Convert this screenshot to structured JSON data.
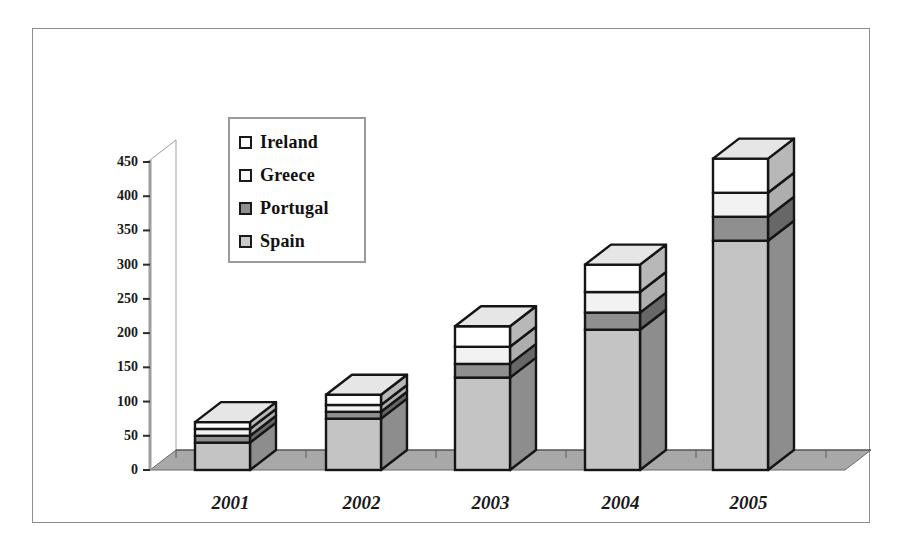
{
  "chart_data": {
    "type": "bar",
    "subtype": "stacked-3d-column",
    "title": "",
    "subtitle": "",
    "xlabel": "",
    "ylabel": "",
    "categories": [
      "2001",
      "2002",
      "2003",
      "2004",
      "2005"
    ],
    "ylim": [
      0,
      450
    ],
    "ytick_step": 50,
    "ytick_labels": [
      "450",
      "400",
      "350",
      "300",
      "250",
      "200",
      "150",
      "100",
      "50",
      "0"
    ],
    "ytick_values": [
      450,
      400,
      350,
      300,
      250,
      200,
      150,
      100,
      50,
      0
    ],
    "grid": false,
    "legend_position": "upper-left-inside",
    "stack_order_bottom_to_top": [
      "Spain",
      "Portugal",
      "Greece",
      "Ireland"
    ],
    "series": [
      {
        "name": "Ireland",
        "color": "#ffffff",
        "values": [
          10,
          15,
          30,
          40,
          50
        ]
      },
      {
        "name": "Greece",
        "color": "#f2f2f2",
        "values": [
          10,
          10,
          25,
          30,
          35
        ]
      },
      {
        "name": "Portugal",
        "color": "#8f8f8f",
        "values": [
          10,
          10,
          20,
          25,
          35
        ]
      },
      {
        "name": "Spain",
        "color": "#c4c4c4",
        "values": [
          40,
          75,
          135,
          205,
          335
        ]
      }
    ],
    "totals": [
      70,
      110,
      210,
      300,
      455
    ]
  },
  "legend": {
    "items": [
      {
        "label": "Ireland",
        "swatch": "#ffffff"
      },
      {
        "label": "Greece",
        "swatch": "#fbfbfb"
      },
      {
        "label": "Portugal",
        "swatch": "#8f8f8f"
      },
      {
        "label": "Spain",
        "swatch": "#c9c9c9"
      }
    ]
  },
  "colors": {
    "floor": "#a8a8a8",
    "floor_edge": "#6a6a6a",
    "axis": "#9d9d9d",
    "outline": "#151515",
    "frame": "#8d8d8d",
    "background": "#ffffff"
  }
}
